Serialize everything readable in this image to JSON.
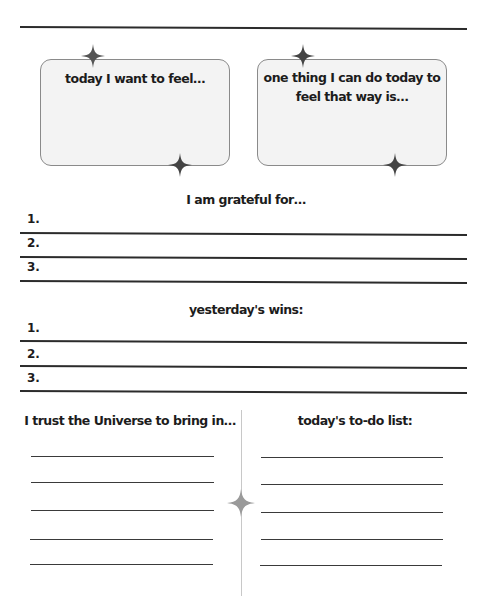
{
  "page": {
    "top_rule": true
  },
  "cards": [
    {
      "title": "today I want to feel…"
    },
    {
      "title_line1": "one thing I can do today to",
      "title_line2": "feel that way is…"
    }
  ],
  "grateful": {
    "heading": "I am grateful for…",
    "items": [
      "1.",
      "2.",
      "3."
    ]
  },
  "wins": {
    "heading": "yesterday's wins:",
    "items": [
      "1.",
      "2.",
      "3."
    ]
  },
  "universe": {
    "heading": "I trust the Universe to bring in…",
    "line_count": 5
  },
  "todo": {
    "heading": "today's to-do list:",
    "line_count": 5
  },
  "colors": {
    "ink": "#1c1c1c",
    "card_fill": "#f3f3f3",
    "card_border": "#8a8a8a",
    "star": "#555555",
    "divider": "#c8c8c8"
  },
  "icons": [
    "sparkle-star-icon"
  ]
}
